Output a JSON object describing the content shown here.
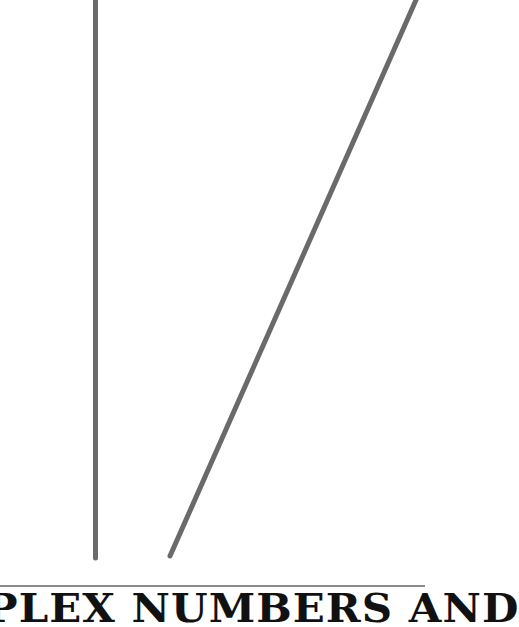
{
  "page": {
    "title_fragment": "PLEX NUMBERS AND",
    "background_color": "#ffffff",
    "text_color": "#111111",
    "line_color": "#6a6a6a",
    "divider_color": "#8a8a8a"
  },
  "artwork": {
    "lines": [
      {
        "name": "vertical-line",
        "x1": 95.5,
        "y1": 0,
        "x2": 95.5,
        "y2": 558,
        "stroke_width": 5
      },
      {
        "name": "diagonal-line",
        "x1": 416,
        "y1": 0,
        "x2": 170,
        "y2": 556,
        "stroke_width": 5
      }
    ]
  }
}
